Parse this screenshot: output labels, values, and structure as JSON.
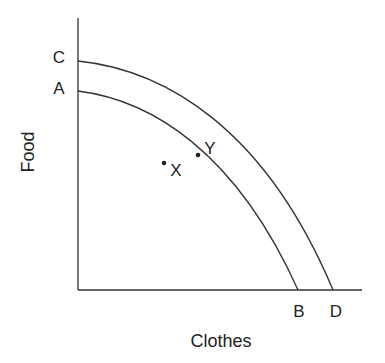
{
  "diagram": {
    "type": "production-possibility-frontier",
    "x_axis_label": "Clothes",
    "y_axis_label": "Food",
    "curves": [
      {
        "name": "inner-ppf",
        "start_label": "A",
        "end_label": "B"
      },
      {
        "name": "outer-ppf",
        "start_label": "C",
        "end_label": "D"
      }
    ],
    "points": [
      {
        "label": "X",
        "position": "inside inner curve"
      },
      {
        "label": "Y",
        "position": "on inner curve"
      }
    ],
    "colors": {
      "line": "#333333",
      "background": "#ffffff"
    }
  }
}
